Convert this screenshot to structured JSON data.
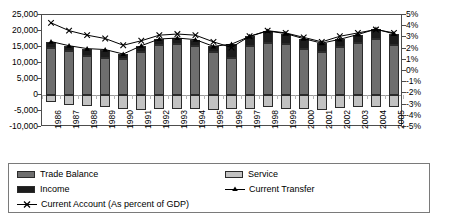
{
  "chart_data": {
    "type": "bar",
    "title": "",
    "subtitle": "",
    "xlabel": "",
    "ylabel": "",
    "y2label": "",
    "grid": false,
    "legend_position": "bottom",
    "categories": [
      "1986",
      "1987",
      "1988",
      "1989",
      "1990",
      "1991",
      "1992",
      "1993",
      "1994",
      "1995",
      "1996",
      "1997",
      "1998",
      "1999",
      "2000",
      "2001",
      "2002",
      "2003",
      "2004",
      "2005"
    ],
    "ylim": [
      -10000,
      25000
    ],
    "yticks": [
      25000,
      20000,
      15000,
      10000,
      5000,
      0,
      -5000,
      -10000
    ],
    "ytick_labels": [
      "25,000",
      "20,000",
      "15,000",
      "10,000",
      "5,000",
      "0",
      "-5,000",
      "-10,000"
    ],
    "y2lim": [
      -5,
      5
    ],
    "y2ticks": [
      5,
      4,
      3,
      2,
      1,
      0,
      -1,
      -2,
      -3,
      -4,
      -5
    ],
    "y2tick_labels": [
      "5%",
      "4%",
      "3%",
      "2%",
      "1%",
      "0%",
      "-1%",
      "-2%",
      "-3%",
      "-4%",
      "-5%"
    ],
    "stacked": true,
    "series": [
      {
        "name": "Trade Balance",
        "type": "bar",
        "color": "#6e6e6e",
        "axis": "left",
        "values": [
          14800,
          13600,
          12200,
          11500,
          11300,
          13300,
          15500,
          15900,
          15300,
          13300,
          11500,
          15200,
          16200,
          15900,
          14400,
          13400,
          15100,
          16200,
          17600,
          15700
        ]
      },
      {
        "name": "Income",
        "type": "bar",
        "color": "#1c1c1c",
        "axis": "left",
        "values": [
          1900,
          1800,
          2300,
          2700,
          1500,
          2100,
          2000,
          1900,
          2000,
          1900,
          4400,
          3100,
          3800,
          3300,
          3200,
          2800,
          2300,
          2700,
          3000,
          3400
        ]
      },
      {
        "name": "Service",
        "type": "bar",
        "color": "#c2c2c2",
        "axis": "left",
        "values": [
          -2100,
          -3100,
          -3500,
          -3800,
          -4400,
          -4600,
          -4500,
          -4500,
          -4400,
          -4600,
          -4400,
          -4300,
          -3600,
          -4300,
          -4500,
          -4600,
          -4100,
          -3700,
          -3600,
          -3800
        ]
      },
      {
        "name": "Current Transfer",
        "type": "line",
        "marker": "triangle",
        "color": "#000000",
        "axis": "left",
        "values": [
          16700,
          15400,
          14500,
          14200,
          12800,
          15400,
          17500,
          17800,
          17300,
          15200,
          15900,
          18300,
          20000,
          19200,
          17600,
          16200,
          17400,
          18900,
          20600,
          19100
        ]
      },
      {
        "name": "Current Account (As percent of GDP)",
        "type": "line",
        "marker": "x",
        "color": "#000000",
        "axis": "right",
        "values": [
          4.3,
          3.6,
          3.2,
          2.9,
          2.3,
          2.7,
          3.2,
          3.3,
          3.2,
          2.6,
          2.1,
          3.1,
          3.6,
          3.4,
          3.0,
          2.6,
          3.1,
          3.4,
          3.7,
          3.4
        ]
      }
    ]
  },
  "legend": {
    "items": [
      {
        "label": "Trade Balance",
        "kind": "swatch",
        "swatch_class": "sw-trade",
        "icon": "legend-swatch-trade"
      },
      {
        "label": "Service",
        "kind": "swatch",
        "swatch_class": "sw-service",
        "icon": "legend-swatch-service"
      },
      {
        "label": "Income",
        "kind": "swatch",
        "swatch_class": "sw-income",
        "icon": "legend-swatch-income"
      },
      {
        "label": "Current Transfer",
        "kind": "marker-triangle",
        "icon": "legend-marker-triangle"
      },
      {
        "label": "Current Account (As percent of GDP)",
        "kind": "marker-x",
        "icon": "legend-marker-x"
      }
    ]
  },
  "colors": {
    "trade_balance": "#6e6e6e",
    "income": "#1c1c1c",
    "service": "#c2c2c2",
    "line": "#000000",
    "frame": "#4d4d4d",
    "zero_line": "#9a9a9a"
  }
}
